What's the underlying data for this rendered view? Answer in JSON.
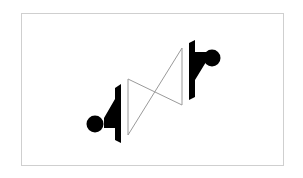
{
  "diagram": {
    "type": "symbol",
    "colors": {
      "frame": "#cfcfcf",
      "fill": "#000000",
      "outline": "#9a9a9a",
      "background": "#ffffff"
    }
  }
}
